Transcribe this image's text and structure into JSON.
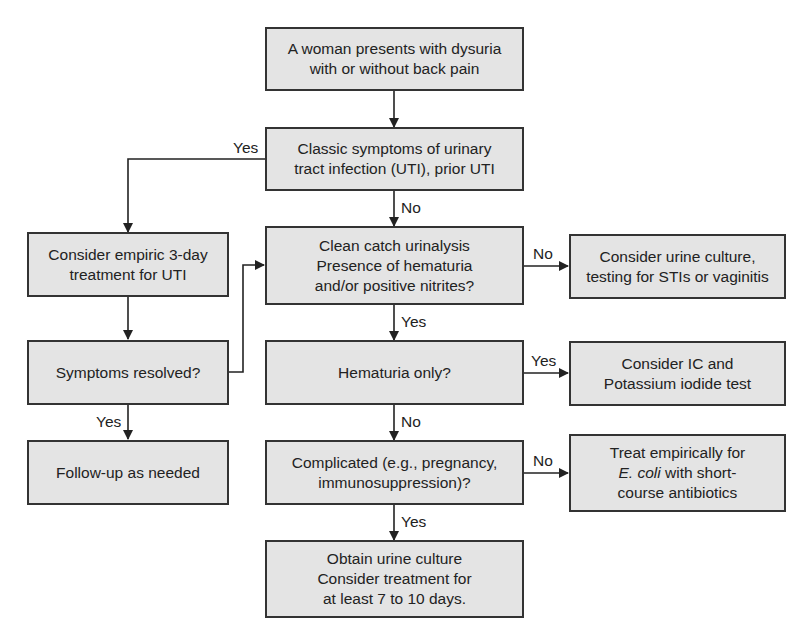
{
  "diagram": {
    "type": "flowchart",
    "nodes": {
      "start": {
        "lines": [
          "A woman presents with dysuria",
          "with or without back pain"
        ]
      },
      "classic": {
        "lines": [
          "Classic symptoms of urinary",
          "tract infection (UTI), prior UTI"
        ]
      },
      "empiric": {
        "lines": [
          "Consider empiric 3-day",
          "treatment for UTI"
        ]
      },
      "resolved": {
        "lines": [
          "Symptoms resolved?"
        ]
      },
      "followup": {
        "lines": [
          "Follow-up as needed"
        ]
      },
      "urinalysis": {
        "lines": [
          "Clean catch urinalysis",
          "Presence of hematuria",
          "and/or positive nitrites?"
        ]
      },
      "culture_sti": {
        "lines": [
          "Consider urine culture,",
          "testing for STIs or vaginitis"
        ]
      },
      "hematuria": {
        "lines": [
          "Hematuria only?"
        ]
      },
      "ic_test": {
        "lines": [
          "Consider IC and",
          "Potassium iodide test"
        ]
      },
      "complicated": {
        "lines": [
          "Complicated (e.g., pregnancy,",
          "immunosuppression)?"
        ]
      },
      "treat_ecoli": {
        "line1": "Treat empirically for",
        "line2_italic": "E. coli",
        "line2_rest": " with short-",
        "line3": "course antibiotics"
      },
      "obtain_culture": {
        "lines": [
          "Obtain urine culture",
          "Consider treatment for",
          "at least 7 to 10 days."
        ]
      }
    },
    "edge_labels": {
      "classic_yes": "Yes",
      "classic_no": "No",
      "urinalysis_no": "No",
      "urinalysis_yes": "Yes",
      "hematuria_yes": "Yes",
      "hematuria_no": "No",
      "complicated_no": "No",
      "complicated_yes": "Yes",
      "resolved_yes": "Yes"
    },
    "colors": {
      "box_fill": "#e4e4e4",
      "border": "#333333",
      "line": "#222222"
    }
  }
}
